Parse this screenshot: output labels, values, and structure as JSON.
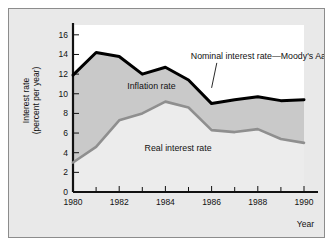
{
  "figure": {
    "background_color": "#e9e9e9",
    "border_color": "#8c8c8c",
    "plot_upper_color": "#ffffff"
  },
  "chart_data": {
    "type": "area",
    "title": "",
    "subtitle": "",
    "xlabel": "Year",
    "ylabel": "Interest rate (percent per year)",
    "xlim": [
      1980,
      1990
    ],
    "ylim": [
      0,
      17
    ],
    "grid": false,
    "legend_position": "inline-annotations",
    "x": [
      1980,
      1981,
      1982,
      1983,
      1984,
      1985,
      1986,
      1987,
      1988,
      1989,
      1990
    ],
    "xticks_major": [
      "1980",
      "1982",
      "1984",
      "1986",
      "1988",
      "1990"
    ],
    "xticks_major_values": [
      1980,
      1982,
      1984,
      1986,
      1988,
      1990
    ],
    "xticks_minor_values": [
      1981,
      1983,
      1985,
      1987,
      1989
    ],
    "yticks": [
      "0",
      "2",
      "4",
      "6",
      "8",
      "10",
      "12",
      "14",
      "16"
    ],
    "ytick_values": [
      0,
      2,
      4,
      6,
      8,
      10,
      12,
      14,
      16
    ],
    "series": [
      {
        "name": "Nominal interest rate—Moody's Aaa",
        "color": "#000000",
        "line_width": 3.0,
        "values": [
          11.9,
          14.2,
          13.8,
          12.0,
          12.7,
          11.4,
          9.0,
          9.4,
          9.7,
          9.3,
          9.4
        ]
      },
      {
        "name": "Real interest rate",
        "color": "#8f8f8f",
        "line_width": 2.6,
        "values": [
          3.0,
          4.6,
          7.3,
          8.0,
          9.2,
          8.6,
          6.3,
          6.1,
          6.4,
          5.4,
          5.0
        ]
      }
    ],
    "bands": [
      {
        "name": "Inflation rate",
        "color": "#c9c9c9",
        "between": [
          "Nominal interest rate—Moody's Aaa",
          "Real interest rate"
        ]
      },
      {
        "name": "Real interest rate",
        "color": "#ececec",
        "between": [
          "Real interest rate",
          "zero"
        ]
      }
    ],
    "annotations": [
      {
        "name": "nominal-label",
        "text": "Nominal interest rate—Moody's Aaa",
        "x": 1985.1,
        "y": 13.55,
        "anchor": "start",
        "leader_to_x": 1986.0,
        "leader_to_y": 10.6
      },
      {
        "name": "inflation-label",
        "text": "Inflation rate",
        "x": 1982.35,
        "y": 10.45,
        "anchor": "start"
      },
      {
        "name": "real-label",
        "text": "Real interest rate",
        "x": 1983.1,
        "y": 4.2,
        "anchor": "start"
      }
    ]
  }
}
